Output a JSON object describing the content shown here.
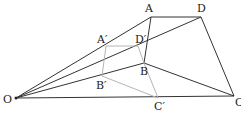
{
  "diagram": {
    "colors": {
      "dark": "#333333",
      "light": "#b5b5b5",
      "background": "#ffffff"
    },
    "points": {
      "O": {
        "label": "O",
        "x": 16,
        "y": 98,
        "lx": 3,
        "ly": 103
      },
      "A": {
        "label": "A",
        "x": 151,
        "y": 17,
        "lx": 145,
        "ly": 12
      },
      "D": {
        "label": "D",
        "x": 201,
        "y": 17,
        "lx": 197,
        "ly": 12
      },
      "B": {
        "label": "B",
        "x": 144,
        "y": 63,
        "lx": 140,
        "ly": 75
      },
      "C": {
        "label": "C",
        "x": 234,
        "y": 96,
        "lx": 235,
        "ly": 106
      },
      "A1": {
        "label": "A′",
        "x": 106,
        "y": 46,
        "lx": 97,
        "ly": 43
      },
      "D1": {
        "label": "D′",
        "x": 138,
        "y": 46,
        "lx": 135,
        "ly": 43
      },
      "B1": {
        "label": "B′",
        "x": 102,
        "y": 76,
        "lx": 96,
        "ly": 89
      },
      "C1": {
        "label": "C′",
        "x": 158,
        "y": 98,
        "lx": 154,
        "ly": 110
      }
    }
  }
}
